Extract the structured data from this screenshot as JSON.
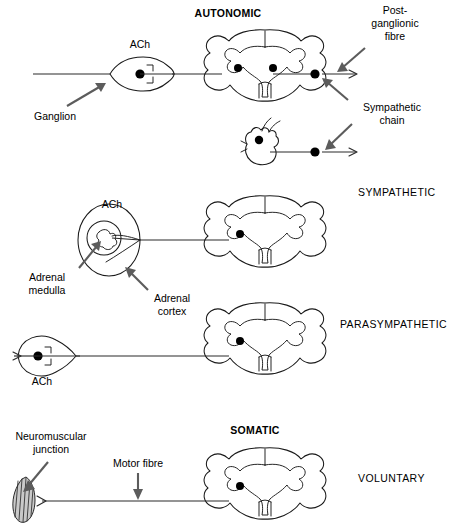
{
  "figure": {
    "width": 450,
    "height": 526,
    "background_color": "#ffffff",
    "ink_color": "#1a1a1a",
    "leader_color": "#5c5c5c",
    "soma_color": "#000000"
  },
  "headings": {
    "autonomic": "AUTONOMIC",
    "somatic": "SOMATIC"
  },
  "divisions": [
    {
      "key": "sympathetic",
      "label": "SYMPATHETIC"
    },
    {
      "key": "parasympathetic",
      "label": "PARASYMPATHETIC"
    },
    {
      "key": "voluntary",
      "label": "VOLUNTARY"
    }
  ],
  "labels": {
    "ach_sympathetic_ganglion": "ACh",
    "ach_adrenal": "ACh",
    "ach_parasympathetic": "ACh",
    "ganglion": "Ganglion",
    "post_ganglionic_fibre_line1": "Post-",
    "post_ganglionic_fibre_line2": "ganglionic",
    "post_ganglionic_fibre_line3": "fibre",
    "sympathetic_chain_line1": "Sympathetic",
    "sympathetic_chain_line2": "chain",
    "adrenal_medulla_line1": "Adrenal",
    "adrenal_medulla_line2": "medulla",
    "adrenal_cortex_line1": "Adrenal",
    "adrenal_cortex_line2": "cortex",
    "neuromuscular_junction_line1": "Neuromuscular",
    "neuromuscular_junction_line2": "junction",
    "motor_fibre": "Motor fibre"
  },
  "rows": [
    {
      "key": "autonomic-sympathetic-ganglionic",
      "division": "SYMPATHETIC",
      "structures": [
        "spinal-cord",
        "sympathetic-ganglion",
        "sympathetic-chain-ganglion",
        "post-ganglionic-fibre"
      ],
      "neurotransmitter": "ACh",
      "cord_cell_bodies": 2
    },
    {
      "key": "autonomic-sympathetic-chain",
      "division": "SYMPATHETIC",
      "structures": [
        "chain-ganglion-blob",
        "post-ganglionic-fibre"
      ],
      "cord_cell_bodies": 0
    },
    {
      "key": "autonomic-sympathetic-adrenal",
      "division": "SYMPATHETIC",
      "structures": [
        "spinal-cord",
        "adrenal-cortex",
        "adrenal-medulla"
      ],
      "neurotransmitter": "ACh",
      "cord_cell_bodies": 1
    },
    {
      "key": "autonomic-parasympathetic",
      "division": "PARASYMPATHETIC",
      "structures": [
        "spinal-cord",
        "parasympathetic-ganglion"
      ],
      "neurotransmitter": "ACh",
      "cord_cell_bodies": 1
    },
    {
      "key": "somatic-voluntary",
      "division": "VOLUNTARY",
      "structures": [
        "spinal-cord",
        "motor-fibre",
        "neuromuscular-junction"
      ],
      "cord_cell_bodies": 1
    }
  ]
}
